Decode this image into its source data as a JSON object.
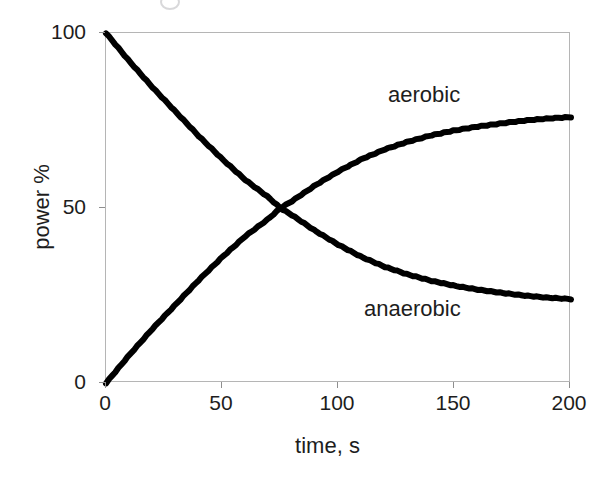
{
  "chart_data": {
    "type": "line",
    "title": "",
    "xlabel": "time, s",
    "ylabel": "power %",
    "xlim": [
      0,
      200
    ],
    "ylim": [
      0,
      100
    ],
    "xticks": [
      "0",
      "50",
      "100",
      "150",
      "200"
    ],
    "yticks": [
      "0",
      "50",
      "100"
    ],
    "grid": false,
    "legend": "inline-annotations",
    "line_color": "#000000",
    "frame_color": "#b5b5b5",
    "annotations": [
      {
        "text": "aerobic",
        "x": 122,
        "y": 88
      },
      {
        "text": "anaerobic",
        "x": 112,
        "y": 28
      }
    ],
    "x": [
      0,
      10,
      20,
      30,
      40,
      50,
      60,
      70,
      75,
      80,
      90,
      100,
      110,
      120,
      130,
      140,
      150,
      160,
      170,
      180,
      190,
      200
    ],
    "series": [
      {
        "name": "aerobic",
        "values": [
          0,
          8,
          15.5,
          22.5,
          29.5,
          36,
          42,
          47,
          50,
          52,
          56.5,
          60.5,
          64,
          66.8,
          69,
          70.8,
          72.2,
          73.3,
          74.2,
          75,
          75.6,
          76
        ]
      },
      {
        "name": "anaerobic",
        "values": [
          100,
          92,
          84.5,
          77.5,
          70.5,
          64,
          58,
          53,
          50,
          48,
          43.5,
          39.5,
          36,
          33.2,
          31,
          29.2,
          27.8,
          26.7,
          25.8,
          25,
          24.4,
          24
        ]
      }
    ]
  },
  "figure": {
    "xlabel": "time, s",
    "ylabel": "power %",
    "xticks": [
      "0",
      "50",
      "100",
      "150",
      "200"
    ],
    "yticks": [
      "0",
      "50",
      "100"
    ],
    "annotation_aerobic": "aerobic",
    "annotation_anaerobic": "anaerobic"
  }
}
